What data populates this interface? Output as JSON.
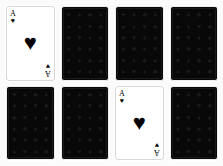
{
  "scene": {
    "title": "Playing cards layout",
    "background_color": "#fbfbfb",
    "rows": 2,
    "columns": 4
  },
  "suits": {
    "heart": "♥",
    "spade": "♠",
    "club": "♣",
    "diamond": "♦"
  },
  "card_back": {
    "background_color": "#080808",
    "pattern_color": "#1e1e1e",
    "border_color": "#ffffff",
    "label": "card-back",
    "pattern_symbols": [
      "♥",
      "♠",
      "♣",
      "♦",
      "♠",
      "♦",
      "♥",
      "♣",
      "♣",
      "♥",
      "♦",
      "♠",
      "♦",
      "♣",
      "♠",
      "♥",
      "♥",
      "♦",
      "♣",
      "♠",
      "♠",
      "♥",
      "♦",
      "♣"
    ]
  },
  "cards": [
    {
      "index": 0,
      "row": 1,
      "column": 1,
      "state": "face-up",
      "rank": "A",
      "suit_name": "heart",
      "suit_symbol": "♥",
      "name": "ace-of-hearts",
      "color": "#000000"
    },
    {
      "index": 1,
      "row": 1,
      "column": 2,
      "state": "face-down",
      "name": "card-back"
    },
    {
      "index": 2,
      "row": 1,
      "column": 3,
      "state": "face-down",
      "name": "card-back"
    },
    {
      "index": 3,
      "row": 1,
      "column": 4,
      "state": "face-down",
      "name": "card-back"
    },
    {
      "index": 4,
      "row": 2,
      "column": 1,
      "state": "face-down",
      "name": "card-back"
    },
    {
      "index": 5,
      "row": 2,
      "column": 2,
      "state": "face-down",
      "name": "card-back"
    },
    {
      "index": 6,
      "row": 2,
      "column": 3,
      "state": "face-up",
      "rank": "A",
      "suit_name": "heart",
      "suit_symbol": "♥",
      "name": "ace-of-hearts",
      "color": "#000000"
    },
    {
      "index": 7,
      "row": 2,
      "column": 4,
      "state": "face-down",
      "name": "card-back"
    }
  ]
}
